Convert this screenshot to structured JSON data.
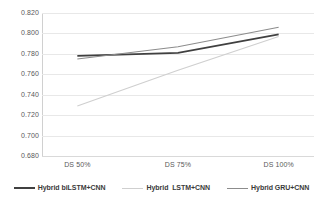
{
  "chart_data": {
    "type": "line",
    "title": "",
    "xlabel": "",
    "ylabel": "",
    "categories": [
      "DS 50%",
      "DS 75%",
      "DS 100%"
    ],
    "ylim": [
      0.68,
      0.82
    ],
    "yticks": [
      "0.820",
      "0.800",
      "0.780",
      "0.760",
      "0.740",
      "0.720",
      "0.700",
      "0.680"
    ],
    "ytick_values": [
      0.82,
      0.8,
      0.78,
      0.76,
      0.74,
      0.72,
      0.7,
      0.68
    ],
    "grid": true,
    "legend_position": "bottom",
    "series": [
      {
        "name": "Hybrid biLSTM+CNN",
        "values": [
          0.778,
          0.781,
          0.799
        ],
        "color": "#404040",
        "width": 1.8
      },
      {
        "name": "Hybrid  LSTM+CNN",
        "values": [
          0.729,
          0.764,
          0.797
        ],
        "color": "#cfcfcf",
        "width": 1.1
      },
      {
        "name": "Hybrid GRU+CNN",
        "values": [
          0.775,
          0.787,
          0.806
        ],
        "color": "#8c8c8c",
        "width": 1.1
      }
    ]
  },
  "legend": {
    "items": [
      {
        "label": "Hybrid biLSTM+CNN"
      },
      {
        "label": "Hybrid  LSTM+CNN"
      },
      {
        "label": "Hybrid GRU+CNN"
      }
    ]
  },
  "colors": {
    "background": "#ffffff",
    "gridline": "#e8e8e8",
    "axis": "#d0d0d0",
    "tick_text": "#595959",
    "legend_text": "#3a3a3a"
  }
}
